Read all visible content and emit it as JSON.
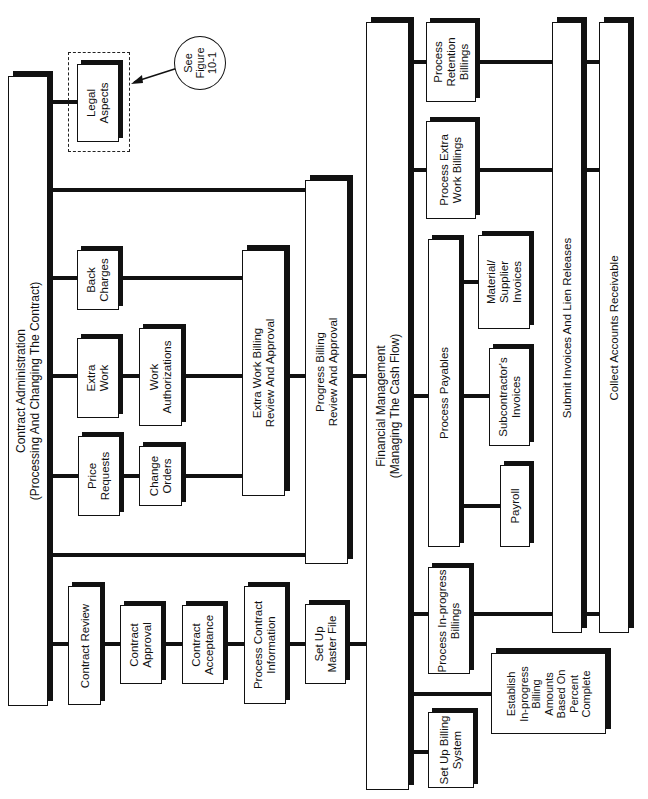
{
  "diagram": {
    "contract_admin": {
      "title": "Contract Administration\n(Processing And Changing The Contract)"
    },
    "legal_aspects": "Legal\nAspects",
    "see_figure": "See\nFigure\n10-1",
    "back_charges": "Back\nCharges",
    "extra_work": "Extra\nWork",
    "price_requests": "Price\nRequests",
    "work_authorizations": "Work\nAuthorizations",
    "change_orders": "Change\nOrders",
    "extra_work_billing": "Extra Work Billing\nReview And Approval",
    "progress_billing": "Progress Billing\nReview And Approval",
    "contract_review": "Contract Review",
    "contract_approval": "Contract\nApproval",
    "contract_acceptance": "Contract\nAcceptance",
    "process_contract_info": "Process Contract\nInformation",
    "set_up_master_file": "Set Up\nMaster File",
    "financial_mgmt": "Financial Management\n(Managing The Cash Flow)",
    "process_retention": "Process\nRetention\nBillings",
    "process_extra_work_billings": "Process Extra\nWork Billings",
    "process_payables": "Process Payables",
    "material_supplier": "Material/\nSupplier\nInvoices",
    "subcontractor": "Subcontractor's\nInvoices",
    "payroll": "Payroll",
    "process_inprogress": "Process In-progress\nBillings",
    "establish_billing": "Establish\nIn-progress\nBilling\nAmounts\nBased On\nPercent\nComplete",
    "set_up_billing": "Set Up Billing\nSystem",
    "submit_invoices": "Submit Invoices And Lien Releases",
    "collect_ar": "Collect Accounts Receivable"
  }
}
